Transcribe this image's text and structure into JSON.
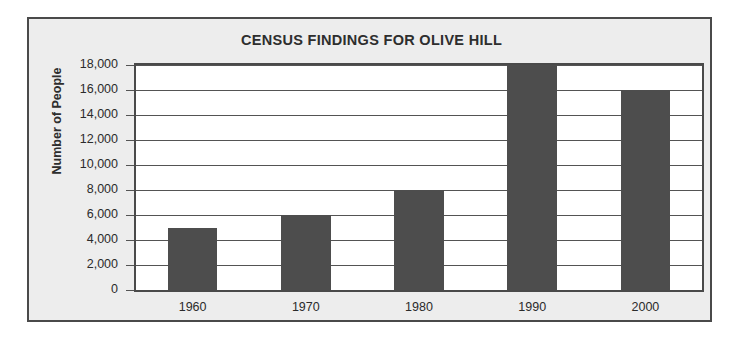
{
  "chart_data": {
    "type": "bar",
    "title": "CENSUS FINDINGS FOR OLIVE HILL",
    "xlabel": "",
    "ylabel": "Number of People",
    "categories": [
      "1960",
      "1970",
      "1980",
      "1990",
      "2000"
    ],
    "values": [
      5000,
      6000,
      8000,
      18000,
      16000
    ],
    "ylim": [
      0,
      18000
    ],
    "ytick_values": [
      0,
      2000,
      4000,
      6000,
      8000,
      10000,
      12000,
      14000,
      16000,
      18000
    ],
    "ytick_labels": [
      "0",
      "2,000",
      "4,000",
      "6,000",
      "8,000",
      "10,000",
      "12,000",
      "14,000",
      "16,000",
      "18,000"
    ],
    "grid": true,
    "grid_axis": "y",
    "legend": false,
    "legend_position": "none",
    "bar_color": "#4d4d4d",
    "plot_background": "#ffffff",
    "figure_background": "#ededed",
    "axis_color": "#4a4a4a",
    "gridline_color": "#545454",
    "text_color": "#2b2b2b"
  }
}
